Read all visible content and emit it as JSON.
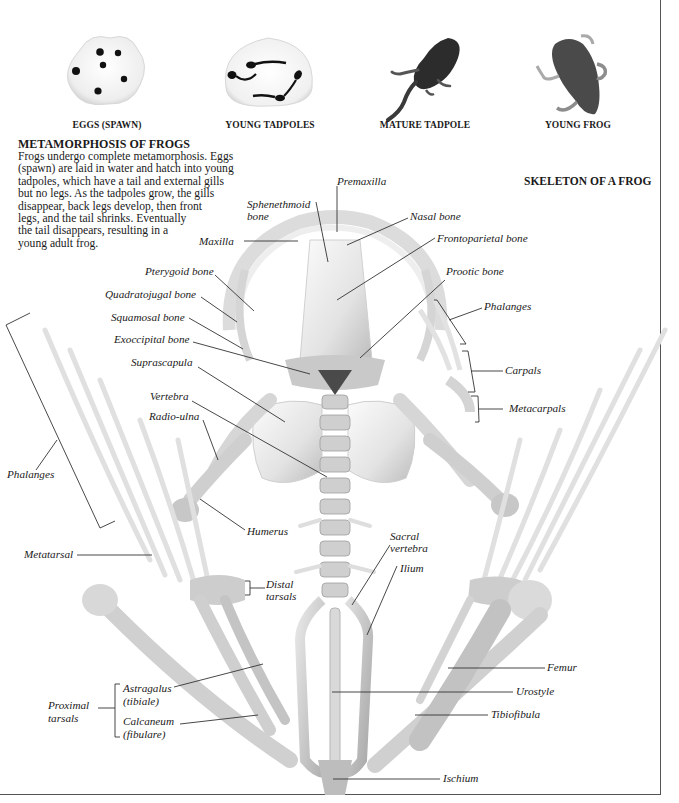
{
  "stages": [
    {
      "id": "eggs",
      "caption": "EGGS (SPAWN)",
      "icon": "frog-spawn-image"
    },
    {
      "id": "young_tadpoles",
      "caption": "YOUNG TADPOLES",
      "icon": "young-tadpoles-image"
    },
    {
      "id": "mature_tadpole",
      "caption": "MATURE TADPOLE",
      "icon": "mature-tadpole-image"
    },
    {
      "id": "young_frog",
      "caption": "YOUNG FROG",
      "icon": "young-frog-image"
    }
  ],
  "intro": {
    "title": "METAMORPHOSIS OF FROGS",
    "lines": [
      "Frogs undergo complete metamorphosis. Eggs",
      "(spawn) are laid in water and hatch into young",
      "tadpoles, which have a tail and external gills",
      "but no legs. As the tadpoles grow, the gills",
      "disappear, back legs develop, then front",
      "legs, and the tail shrinks. Eventually",
      "the tail disappears, resulting in a",
      "young adult frog."
    ]
  },
  "skeleton": {
    "title": "SKELETON OF A FROG",
    "labels": {
      "premaxilla": "Premaxilla",
      "sphenethmoid_1": "Sphenethmoid",
      "sphenethmoid_2": "bone",
      "nasal": "Nasal bone",
      "maxilla": "Maxilla",
      "frontoparietal": "Frontoparietal bone",
      "prootic": "Prootic bone",
      "pterygoid": "Pterygoid bone",
      "quadratojugal": "Quadratojugal bone",
      "squamosal": "Squamosal bone",
      "exoccipital": "Exoccipital bone",
      "suprascapula": "Suprascapula",
      "vertebra": "Vertebra",
      "radio_ulna": "Radio-ulna",
      "phalanges_hand": "Phalanges",
      "carpals": "Carpals",
      "metacarpals": "Metacarpals",
      "phalanges_foot": "Phalanges",
      "humerus": "Humerus",
      "metatarsal": "Metatarsal",
      "sacral_1": "Sacral",
      "sacral_2": "vertebra",
      "ilium": "Ilium",
      "distal_1": "Distal",
      "distal_2": "tarsals",
      "femur": "Femur",
      "astragalus_1": "Astragalus",
      "astragalus_2": "(tibiale)",
      "urostyle": "Urostyle",
      "proximal_1": "Proximal",
      "proximal_2": "tarsals",
      "calcaneum_1": "Calcaneum",
      "calcaneum_2": "(fibulare)",
      "tibiofibula": "Tibiofibula",
      "ischium": "Ischium"
    }
  },
  "colors": {
    "text": "#1a1a1a",
    "leader_line": "#333333",
    "bone_light": "#f2f2f2",
    "bone_mid": "#d6d6d6",
    "bone_shadow": "#a8a8a8",
    "creature_dark": "#2a2a2a",
    "border": "#555555"
  }
}
